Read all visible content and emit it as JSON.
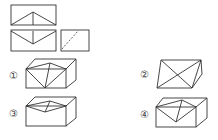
{
  "views": {
    "top_view": "top-view",
    "front_view": "front-view",
    "side_view": "side-view"
  },
  "options": [
    {
      "id": "opt1",
      "label": "①"
    },
    {
      "id": "opt2",
      "label": "②"
    },
    {
      "id": "opt3",
      "label": "③"
    },
    {
      "id": "opt4",
      "label": "④"
    }
  ],
  "colors": {
    "line": "#333333"
  }
}
